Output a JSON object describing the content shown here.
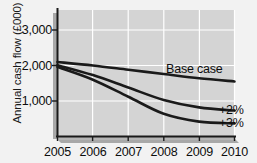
{
  "chart_data": {
    "type": "line",
    "title": "",
    "xlabel": "",
    "ylabel": "Annual cash flow (£000)",
    "categories": [
      "2005",
      "2006",
      "2007",
      "2008",
      "2009",
      "2010"
    ],
    "x": [
      2005,
      2006,
      2007,
      2008,
      2009,
      2010
    ],
    "xlim": [
      2005,
      2010
    ],
    "ylim": [
      0,
      3300
    ],
    "yticks": [
      1000,
      2000,
      3000
    ],
    "ytick_labels": [
      "1,000",
      "2,000",
      "3,000"
    ],
    "grid": true,
    "legend_position": "inline-right",
    "series": [
      {
        "name": "Base case",
        "label": "Base case",
        "color": "#1a1a1a",
        "values": [
          2100,
          2000,
          1880,
          1760,
          1640,
          1550
        ]
      },
      {
        "name": "+2%",
        "label": "+2%",
        "color": "#1a1a1a",
        "values": [
          2010,
          1730,
          1380,
          1030,
          820,
          730
        ]
      },
      {
        "name": "+3%",
        "label": "+3%",
        "color": "#1a1a1a",
        "values": [
          1960,
          1600,
          1120,
          640,
          420,
          370
        ]
      }
    ],
    "annotations": [
      {
        "text": "Base case",
        "x": 2008.55,
        "y": 1930
      },
      {
        "text": "+2%",
        "x": 2010.15,
        "y": 760
      },
      {
        "text": "+3%",
        "x": 2010.15,
        "y": 390
      }
    ],
    "colors": {
      "plot_background": "#d4d4d4",
      "figure_background": "#f2f2f2",
      "gridline": "#ffffff",
      "axis": "#1a1a1a",
      "axis_shadow": "#9a9a9a",
      "line": "#1a1a1a",
      "text": "#0d0d0d"
    }
  }
}
